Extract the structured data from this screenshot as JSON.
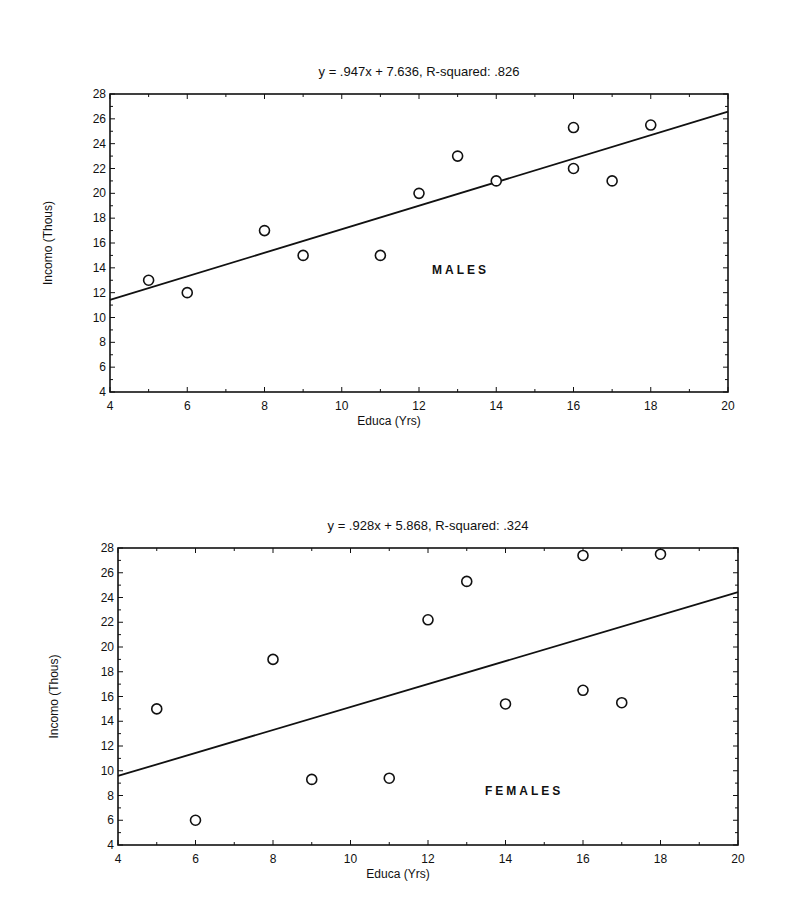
{
  "chart_data": [
    {
      "type": "scatter",
      "title": "y  =  .947x  +  7.636,  R-squared:  .826",
      "group_label": "MALES",
      "xlabel": "Educa (Yrs)",
      "ylabel": "Incomo (Thous)",
      "xlim": [
        4,
        20
      ],
      "ylim": [
        4,
        28
      ],
      "xticks": [
        4,
        6,
        8,
        10,
        12,
        14,
        16,
        18,
        20
      ],
      "yticks": [
        4,
        6,
        8,
        10,
        12,
        14,
        16,
        18,
        20,
        22,
        24,
        26,
        28
      ],
      "grid": false,
      "regression": {
        "slope": 0.947,
        "intercept": 7.636,
        "r_squared": 0.826
      },
      "points": [
        {
          "x": 5,
          "y": 13
        },
        {
          "x": 6,
          "y": 12
        },
        {
          "x": 8,
          "y": 17
        },
        {
          "x": 9,
          "y": 15
        },
        {
          "x": 11,
          "y": 15
        },
        {
          "x": 12,
          "y": 20
        },
        {
          "x": 13,
          "y": 23
        },
        {
          "x": 14,
          "y": 21
        },
        {
          "x": 16,
          "y": 25.3
        },
        {
          "x": 16,
          "y": 22
        },
        {
          "x": 17,
          "y": 21
        },
        {
          "x": 18,
          "y": 25.5
        }
      ]
    },
    {
      "type": "scatter",
      "title": "y  =  .928x  +  5.868,  R-squared:  .324",
      "group_label": "FEMALES",
      "xlabel": "Educa (Yrs)",
      "ylabel": "Incomo (Thous)",
      "xlim": [
        4,
        20
      ],
      "ylim": [
        4,
        28
      ],
      "xticks": [
        4,
        6,
        8,
        10,
        12,
        14,
        16,
        18,
        20
      ],
      "yticks": [
        4,
        6,
        8,
        10,
        12,
        14,
        16,
        18,
        20,
        22,
        24,
        26,
        28
      ],
      "grid": false,
      "regression": {
        "slope": 0.928,
        "intercept": 5.868,
        "r_squared": 0.324
      },
      "points": [
        {
          "x": 5,
          "y": 15
        },
        {
          "x": 6,
          "y": 6
        },
        {
          "x": 8,
          "y": 19
        },
        {
          "x": 9,
          "y": 9.3
        },
        {
          "x": 11,
          "y": 9.4
        },
        {
          "x": 12,
          "y": 22.2
        },
        {
          "x": 13,
          "y": 25.3
        },
        {
          "x": 14,
          "y": 15.4
        },
        {
          "x": 16,
          "y": 27.4
        },
        {
          "x": 16,
          "y": 16.5
        },
        {
          "x": 17,
          "y": 15.5
        },
        {
          "x": 18,
          "y": 27.5
        }
      ]
    }
  ]
}
